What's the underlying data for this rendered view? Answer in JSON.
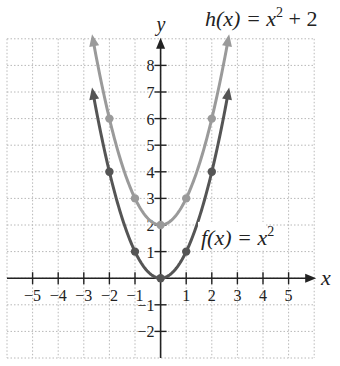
{
  "chart_data": {
    "type": "line",
    "title": "",
    "xlabel": "x",
    "ylabel": "y",
    "xlim": [
      -6,
      6
    ],
    "ylim": [
      -3,
      9
    ],
    "grid": true,
    "grid_style": "dotted",
    "x_ticks": [
      -5,
      -4,
      -3,
      -2,
      -1,
      1,
      2,
      3,
      4,
      5
    ],
    "x_tick_labels": [
      "−5",
      "−4",
      "−3",
      "−2",
      "−1",
      "1",
      "2",
      "3",
      "4",
      "5"
    ],
    "y_ticks": [
      -2,
      -1,
      1,
      2,
      3,
      4,
      5,
      6,
      7,
      8
    ],
    "y_tick_labels": [
      "−2",
      "−1",
      "1",
      "2",
      "3",
      "4",
      "5",
      "6",
      "7",
      "8"
    ],
    "series": [
      {
        "name": "f(x) = x²",
        "label_func": "f(x) = x",
        "label_exp": "2",
        "label_tail": "",
        "color": "#555555",
        "points": [
          [
            -2,
            4
          ],
          [
            -1,
            1
          ],
          [
            0,
            0
          ],
          [
            1,
            1
          ],
          [
            2,
            4
          ]
        ],
        "domain": [
          -2.65,
          2.65
        ]
      },
      {
        "name": "h(x) = x² + 2",
        "label_func": "h(x) = x",
        "label_exp": "2",
        "label_tail": " + 2",
        "color": "#9a9a9a",
        "points": [
          [
            -2,
            6
          ],
          [
            -1,
            3
          ],
          [
            0,
            2
          ],
          [
            1,
            3
          ],
          [
            2,
            6
          ]
        ],
        "domain": [
          -2.65,
          2.65
        ]
      }
    ]
  }
}
